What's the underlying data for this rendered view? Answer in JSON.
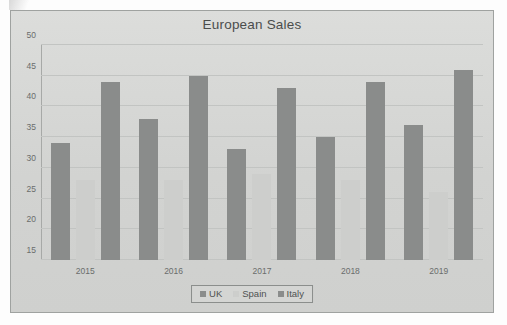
{
  "chart_data": {
    "type": "bar",
    "title": "European Sales",
    "xlabel": "",
    "ylabel": "",
    "categories": [
      "2015",
      "2016",
      "2017",
      "2018",
      "2019"
    ],
    "series": [
      {
        "name": "UK",
        "values": [
          34,
          38,
          33,
          35,
          37
        ],
        "color": "#8a8c8b"
      },
      {
        "name": "Spain",
        "values": [
          28,
          28,
          29,
          28,
          26
        ],
        "color": "#cdcecc"
      },
      {
        "name": "Italy",
        "values": [
          44,
          45,
          43,
          44,
          46
        ],
        "color": "#8a8c8b"
      }
    ],
    "ylim": [
      15,
      50
    ],
    "ytick_values": [
      15,
      20,
      25,
      30,
      35,
      40,
      45,
      50
    ],
    "ytick_labels": [
      "15",
      "20",
      "25",
      "30",
      "35",
      "40",
      "45",
      "50"
    ],
    "grid": true,
    "legend_position": "bottom"
  },
  "legend": {
    "items": [
      {
        "label": "UK"
      },
      {
        "label": "Spain"
      },
      {
        "label": "Italy"
      }
    ]
  },
  "colors": {
    "plot_background": "#d7d8d6",
    "frame_border": "#9fa2a0",
    "gridline": "#c2c4c2",
    "text": "#6a6d6c",
    "title_text": "#4a4d4c"
  }
}
